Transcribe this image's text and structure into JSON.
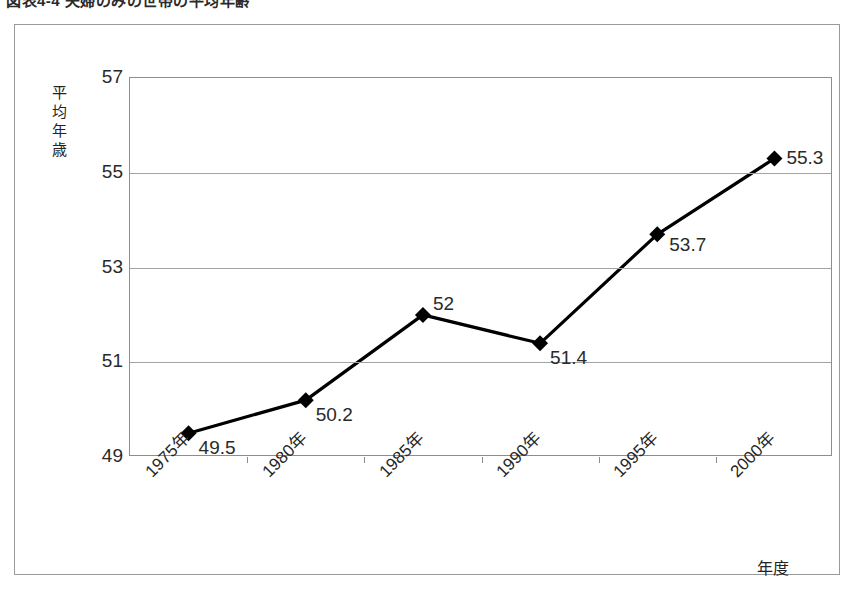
{
  "document": {
    "title_cropped": "図表4-4 夫婦のみの世帯の平均年齢"
  },
  "chart_data": {
    "type": "line",
    "title": "",
    "xlabel": "年度",
    "ylabel": "平均年歳",
    "categories": [
      "1975年",
      "1980年",
      "1985年",
      "1990年",
      "1995年",
      "2000年"
    ],
    "values": [
      49.5,
      50.2,
      52,
      51.4,
      53.7,
      55.3
    ],
    "point_labels": [
      "49.5",
      "50.2",
      "52",
      "51.4",
      "53.7",
      "55.3"
    ],
    "ylim": [
      49,
      57
    ],
    "yticks": [
      57,
      55,
      53,
      51,
      49
    ],
    "ytick_labels": [
      "57",
      "55",
      "53",
      "51",
      "49"
    ],
    "grid": true,
    "legend": "none",
    "series": [
      {
        "name": "平均年歳",
        "values": [
          49.5,
          50.2,
          52,
          51.4,
          53.7,
          55.3
        ],
        "marker": "diamond",
        "color": "#000000"
      }
    ]
  },
  "colors": {
    "line": "#000000",
    "marker": "#000000",
    "grid": "#a3a3a3",
    "frame": "#9a9a9a",
    "text": "#2a2a2a"
  }
}
